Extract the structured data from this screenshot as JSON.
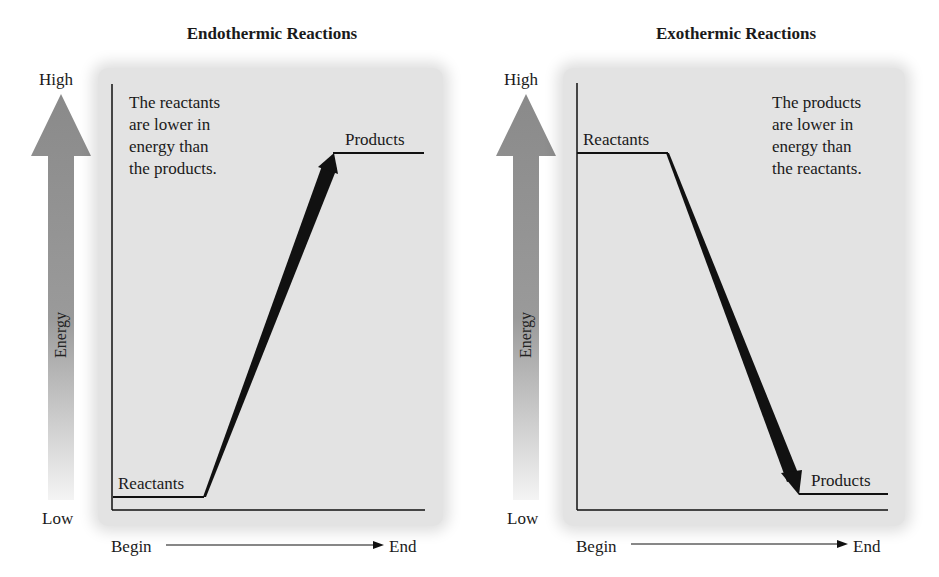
{
  "diagrams": [
    {
      "id": "endothermic",
      "title": "Endothermic Reactions",
      "y_axis": {
        "label": "Energy",
        "high": "High",
        "low": "Low"
      },
      "x_axis": {
        "begin": "Begin",
        "end": "End"
      },
      "reactants_label": "Reactants",
      "products_label": "Products",
      "note": [
        "The reactants",
        "are lower in",
        "energy than",
        "the products."
      ],
      "reactants_energy_level": "low",
      "products_energy_level": "high",
      "arrow_direction": "up"
    },
    {
      "id": "exothermic",
      "title": "Exothermic Reactions",
      "y_axis": {
        "label": "Energy",
        "high": "High",
        "low": "Low"
      },
      "x_axis": {
        "begin": "Begin",
        "end": "End"
      },
      "reactants_label": "Reactants",
      "products_label": "Products",
      "note": [
        "The products",
        "are lower in",
        "energy than",
        "the reactants."
      ],
      "reactants_energy_level": "high",
      "products_energy_level": "low",
      "arrow_direction": "down"
    }
  ],
  "colors": {
    "panel_bg": "#e3e3e3",
    "line": "#111111",
    "energy_arrow_top": "#8a8a8a",
    "energy_arrow_bottom": "#f2f2f2"
  }
}
